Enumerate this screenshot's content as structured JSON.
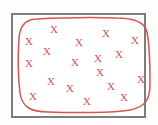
{
  "figure": {
    "background_color": "#fdfdfc",
    "canvas": {
      "width": 158,
      "height": 125
    }
  },
  "frame": {
    "name": "outer-frame",
    "x": 11,
    "y": 13,
    "width": 135,
    "height": 105,
    "stroke_color": "#7d7d7d",
    "stroke_width": 2,
    "fill_color": "#ffffff"
  },
  "curve": {
    "name": "closed-boundary-curve",
    "stroke_color": "#d9544d",
    "stroke_width": 1.5,
    "shape": "rounded-rectangle-blob",
    "path": "M 37 19 C 26 19 20 25 19 38 C 18 52 18 76 20 93 C 22 107 31 112 48 112 C 72 113 112 113 130 110 C 145 107 150 100 150 84 C 150 64 149 42 147 32 C 145 22 135 18 116 18 C 92 17 56 18 37 19 Z"
  },
  "marks": {
    "name": "x-marks",
    "glyph": "×",
    "label": "X",
    "color": "#d4544e",
    "font_size": 11,
    "count": 18,
    "points": [
      {
        "id": "x1",
        "x": 54,
        "y": 29
      },
      {
        "id": "x2",
        "x": 106,
        "y": 33
      },
      {
        "id": "x3",
        "x": 29,
        "y": 41
      },
      {
        "id": "x4",
        "x": 79,
        "y": 42
      },
      {
        "id": "x5",
        "x": 135,
        "y": 40
      },
      {
        "id": "x6",
        "x": 47,
        "y": 51
      },
      {
        "id": "x7",
        "x": 98,
        "y": 58
      },
      {
        "id": "x8",
        "x": 119,
        "y": 54
      },
      {
        "id": "x9",
        "x": 29,
        "y": 63
      },
      {
        "id": "x10",
        "x": 75,
        "y": 62
      },
      {
        "id": "x11",
        "x": 100,
        "y": 72
      },
      {
        "id": "x12",
        "x": 141,
        "y": 79
      },
      {
        "id": "x13",
        "x": 51,
        "y": 81
      },
      {
        "id": "x14",
        "x": 70,
        "y": 88
      },
      {
        "id": "x15",
        "x": 111,
        "y": 86
      },
      {
        "id": "x16",
        "x": 33,
        "y": 96
      },
      {
        "id": "x17",
        "x": 87,
        "y": 101
      },
      {
        "id": "x18",
        "x": 124,
        "y": 97
      }
    ]
  }
}
